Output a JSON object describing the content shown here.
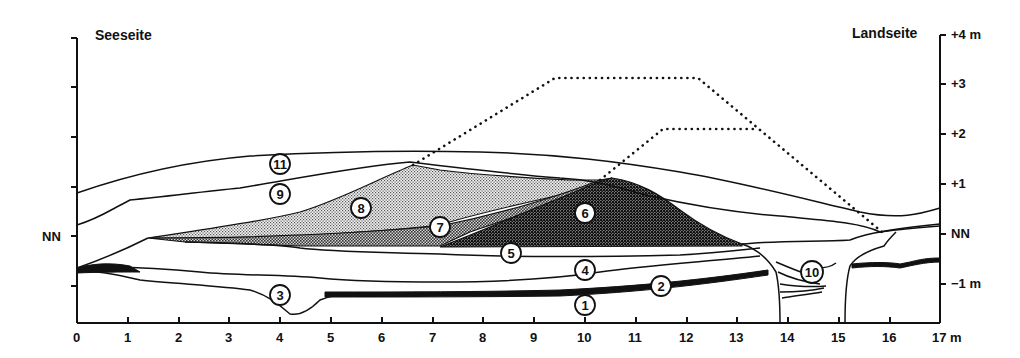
{
  "figure": {
    "title_left": "Seeseite",
    "title_right": "Landseite",
    "left_axis": {
      "label_nn": "NN"
    },
    "right_axis": {
      "ticks": [
        "+4 m",
        "+3",
        "+2",
        "+1",
        "NN",
        "−1 m"
      ]
    },
    "x_axis": {
      "ticks": [
        "0",
        "1",
        "2",
        "3",
        "4",
        "5",
        "6",
        "7",
        "8",
        "9",
        "10",
        "11",
        "12",
        "13",
        "14",
        "15",
        "16",
        "17 m"
      ]
    },
    "layers": [
      {
        "id": "1",
        "label": "1",
        "fill": "none"
      },
      {
        "id": "2",
        "label": "2",
        "fill": "solid-black-band"
      },
      {
        "id": "3",
        "label": "3",
        "fill": "none"
      },
      {
        "id": "4",
        "label": "4",
        "fill": "none"
      },
      {
        "id": "5",
        "label": "5",
        "fill": "none"
      },
      {
        "id": "6",
        "label": "6",
        "fill": "dark-stipple"
      },
      {
        "id": "7",
        "label": "7",
        "fill": "medium-stipple"
      },
      {
        "id": "8",
        "label": "8",
        "fill": "light-stipple"
      },
      {
        "id": "9",
        "label": "9",
        "fill": "none"
      },
      {
        "id": "10",
        "label": "10",
        "fill": "hatched-lines"
      },
      {
        "id": "11",
        "label": "11",
        "fill": "none"
      }
    ],
    "colors": {
      "ink": "#111111",
      "background": "#ffffff",
      "stipple_light": "#d0d0d0",
      "stipple_medium": "#a8a8a8",
      "stipple_dark": "#4a4a4a"
    }
  }
}
